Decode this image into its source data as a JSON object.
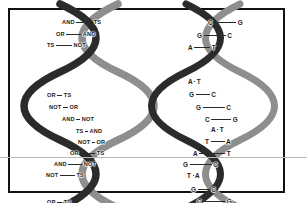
{
  "figure": {
    "background_color": "#ffffff",
    "frame_color": "#111111",
    "scanline_color": "#b9b9b9",
    "strand_dark_color": "#2b2b2b",
    "strand_light_color": "#8e8e8e",
    "bond_color": "#2a2a2a",
    "text_color": "#1a1a1a"
  },
  "helices": [
    {
      "id": "logic-helix",
      "name": "logic-operator-helix",
      "side": "left",
      "rungs": [
        {
          "left": "AND",
          "right": "TS",
          "x": 22,
          "y": 9,
          "bond": 16,
          "w": 84
        },
        {
          "left": "OR",
          "right": "AND",
          "x": 16,
          "y": 21,
          "bond": 15,
          "w": 84
        },
        {
          "left": "TS",
          "right": "NOT",
          "x": 7,
          "y": 32,
          "bond": 16,
          "w": 84
        },
        {
          "left": "OR",
          "right": "TS",
          "x": 7,
          "y": 82,
          "bond": 5,
          "w": 84
        },
        {
          "left": "NOT",
          "right": "OR",
          "x": 9,
          "y": 94,
          "bond": 5,
          "w": 84
        },
        {
          "left": "AND",
          "right": "NOT",
          "x": 22,
          "y": 106,
          "bond": 4,
          "w": 84
        },
        {
          "left": "TS",
          "right": "AND",
          "x": 36,
          "y": 118,
          "bond": 3,
          "w": 84
        },
        {
          "left": "NOT",
          "right": "OR",
          "x": 38,
          "y": 129,
          "bond": 3,
          "w": 84
        },
        {
          "left": "OR",
          "right": "TS",
          "x": 30,
          "y": 140,
          "bond": 15,
          "w": 84
        },
        {
          "left": "AND",
          "right": "NOT",
          "x": 14,
          "y": 151,
          "bond": 14,
          "w": 84
        },
        {
          "left": "NOT",
          "right": "TS",
          "x": 6,
          "y": 162,
          "bond": 15,
          "w": 84
        },
        {
          "left": "OR",
          "right": "TS",
          "x": 7,
          "y": 189,
          "bond": 5,
          "w": 84
        }
      ]
    },
    {
      "id": "dna-helix",
      "name": "dna-base-pair-helix",
      "side": "right",
      "rungs": [
        {
          "left": "C",
          "right": "G",
          "x": 40,
          "y": 9,
          "bond": 22,
          "w": 60
        },
        {
          "left": "G",
          "right": "C",
          "x": 29,
          "y": 22,
          "bond": 22,
          "w": 60
        },
        {
          "left": "A",
          "right": "T",
          "x": 20,
          "y": 34,
          "bond": 16,
          "w": 60
        },
        {
          "left": "A",
          "right": "T",
          "x": 20,
          "y": 68,
          "bond": 1,
          "w": 60
        },
        {
          "left": "G",
          "right": "C",
          "x": 21,
          "y": 81,
          "bond": 14,
          "w": 60
        },
        {
          "left": "G",
          "right": "C",
          "x": 28,
          "y": 94,
          "bond": 22,
          "w": 60
        },
        {
          "left": "C",
          "right": "G",
          "x": 37,
          "y": 106,
          "bond": 20,
          "w": 60
        },
        {
          "left": "A",
          "right": "T",
          "x": 43,
          "y": 116,
          "bond": 1,
          "w": 60
        },
        {
          "left": "T",
          "right": "A",
          "x": 37,
          "y": 128,
          "bond": 14,
          "w": 60
        },
        {
          "left": "A",
          "right": "T",
          "x": 25,
          "y": 140,
          "bond": 26,
          "w": 60
        },
        {
          "left": "G",
          "right": "C",
          "x": 15,
          "y": 151,
          "bond": 22,
          "w": 60
        },
        {
          "left": "T",
          "right": "A",
          "x": 19,
          "y": 162,
          "bond": 1,
          "w": 60
        },
        {
          "left": "G",
          "right": "C",
          "x": 23,
          "y": 176,
          "bond": 12,
          "w": 60
        },
        {
          "left": "C",
          "right": "G",
          "x": 29,
          "y": 188,
          "bond": 22,
          "w": 60
        },
        {
          "left": "A",
          "right": "T",
          "x": 42,
          "y": 199,
          "bond": 24,
          "w": 60
        }
      ]
    }
  ]
}
